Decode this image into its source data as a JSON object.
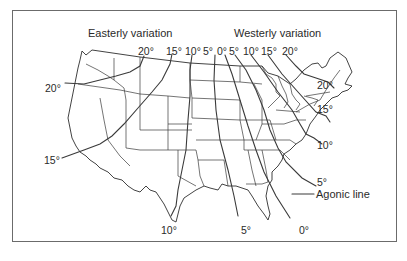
{
  "map": {
    "headings": {
      "easterly": "Easterly variation",
      "westerly": "Westerly variation"
    },
    "isogonic_lines": [
      {
        "id": "e20",
        "value": "20°",
        "direction": "easterly"
      },
      {
        "id": "e15",
        "value": "15°",
        "direction": "easterly"
      },
      {
        "id": "e10",
        "value": "10°",
        "direction": "easterly"
      },
      {
        "id": "e5",
        "value": "5°",
        "direction": "easterly"
      },
      {
        "id": "agonic",
        "value": "0°",
        "direction": "none"
      },
      {
        "id": "w5",
        "value": "5°",
        "direction": "westerly"
      },
      {
        "id": "w10",
        "value": "10°",
        "direction": "westerly"
      },
      {
        "id": "w15",
        "value": "15°",
        "direction": "westerly"
      },
      {
        "id": "w20",
        "value": "20°",
        "direction": "westerly"
      }
    ],
    "top_labels": [
      "20°",
      "15°",
      "10°",
      "5°",
      "0°",
      "5°",
      "10°",
      "15°",
      "20°"
    ],
    "left_labels": {
      "upper": "20°",
      "lower": "15°"
    },
    "right_labels": [
      "20°",
      "15°",
      "10°",
      "5°"
    ],
    "bottom_labels": [
      "10°",
      "5°",
      "0°"
    ],
    "agonic_callout": "Agonic line",
    "colors": {
      "ink": "#2e2e2e",
      "frame": "#6b6b6b",
      "background": "#ffffff"
    }
  }
}
